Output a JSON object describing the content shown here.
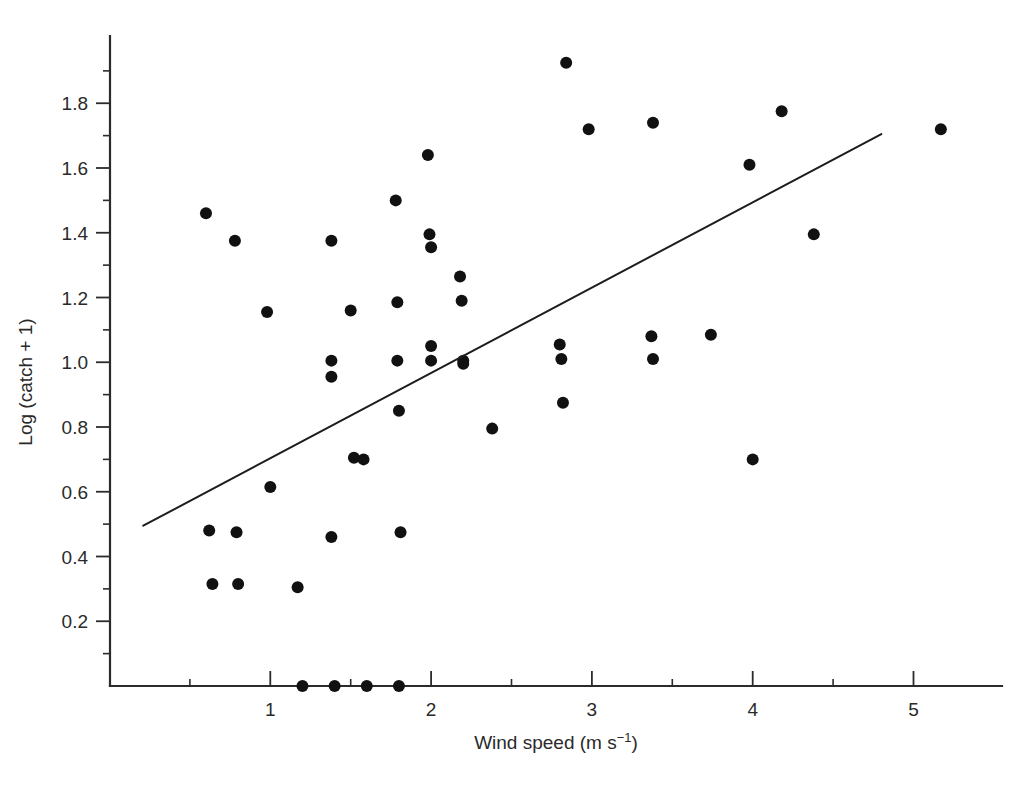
{
  "figure": {
    "background": "#ffffff",
    "point_color": "#111111",
    "line_color": "#1d1d1d",
    "axis_color": "#2b2b2b"
  },
  "axes": {
    "x_title_main": "Wind speed (m s",
    "x_title_sup": "−1",
    "x_title_tail": ")",
    "x_title_full": "Wind speed (m s−1)",
    "y_title": "Log (catch + 1)",
    "x_ticks": [
      1,
      2,
      3,
      4,
      5
    ],
    "x_tick_labels": [
      "1",
      "2",
      "3",
      "4",
      "5"
    ],
    "y_ticks": [
      0.2,
      0.4,
      0.6,
      0.8,
      1.0,
      1.2,
      1.4,
      1.6,
      1.8
    ],
    "y_tick_labels": [
      "0.2",
      "0.4",
      "0.6",
      "0.8",
      "1.0",
      "1.2",
      "1.4",
      "1.6",
      "1.8"
    ],
    "x_minor_ticks": [
      0.5,
      1.5,
      2.5,
      3.5,
      4.5
    ],
    "y_minor_ticks": [
      0.1,
      0.3,
      0.5,
      0.7,
      0.9,
      1.1,
      1.3,
      1.5,
      1.7,
      1.9
    ],
    "xlim": [
      0,
      5.6
    ],
    "ylim": [
      0,
      1.98
    ],
    "tick_direction_x": "in",
    "tick_direction_y": "out",
    "grid": false,
    "legend": "none"
  },
  "chart_data": {
    "type": "scatter",
    "title": "",
    "subtitle": "",
    "xlabel": "Wind speed (m s−1)",
    "ylabel": "Log (catch + 1)",
    "xlim": [
      0,
      5.6
    ],
    "ylim": [
      0,
      1.98
    ],
    "grid": false,
    "legend_position": "none",
    "marker": "filled-circle",
    "n_points": 60,
    "points": [
      {
        "x": 0.6,
        "y": 1.46
      },
      {
        "x": 0.62,
        "y": 0.48
      },
      {
        "x": 0.64,
        "y": 0.315
      },
      {
        "x": 0.78,
        "y": 1.375
      },
      {
        "x": 0.79,
        "y": 0.475
      },
      {
        "x": 0.8,
        "y": 0.315
      },
      {
        "x": 0.98,
        "y": 1.155
      },
      {
        "x": 1.0,
        "y": 0.615
      },
      {
        "x": 1.17,
        "y": 0.305
      },
      {
        "x": 1.2,
        "y": 0.0
      },
      {
        "x": 1.38,
        "y": 1.375
      },
      {
        "x": 1.38,
        "y": 1.005
      },
      {
        "x": 1.38,
        "y": 0.955
      },
      {
        "x": 1.38,
        "y": 0.46
      },
      {
        "x": 1.4,
        "y": 0.0
      },
      {
        "x": 1.5,
        "y": 1.16
      },
      {
        "x": 1.52,
        "y": 0.705
      },
      {
        "x": 1.58,
        "y": 0.7
      },
      {
        "x": 1.6,
        "y": 0.0
      },
      {
        "x": 1.78,
        "y": 1.5
      },
      {
        "x": 1.79,
        "y": 1.185
      },
      {
        "x": 1.79,
        "y": 1.005
      },
      {
        "x": 1.8,
        "y": 0.85
      },
      {
        "x": 1.81,
        "y": 0.475
      },
      {
        "x": 1.8,
        "y": 0.0
      },
      {
        "x": 1.98,
        "y": 1.64
      },
      {
        "x": 1.99,
        "y": 1.395
      },
      {
        "x": 2.0,
        "y": 1.355
      },
      {
        "x": 2.0,
        "y": 1.05
      },
      {
        "x": 2.0,
        "y": 1.005
      },
      {
        "x": 2.18,
        "y": 1.265
      },
      {
        "x": 2.19,
        "y": 1.19
      },
      {
        "x": 2.2,
        "y": 1.005
      },
      {
        "x": 2.2,
        "y": 0.995
      },
      {
        "x": 2.38,
        "y": 0.795
      },
      {
        "x": 2.8,
        "y": 1.055
      },
      {
        "x": 2.81,
        "y": 1.01
      },
      {
        "x": 2.82,
        "y": 0.875
      },
      {
        "x": 2.84,
        "y": 1.925
      },
      {
        "x": 2.98,
        "y": 1.72
      },
      {
        "x": 3.38,
        "y": 1.74
      },
      {
        "x": 3.37,
        "y": 1.08
      },
      {
        "x": 3.38,
        "y": 1.01
      },
      {
        "x": 3.74,
        "y": 1.085
      },
      {
        "x": 3.98,
        "y": 1.61
      },
      {
        "x": 4.0,
        "y": 0.7
      },
      {
        "x": 4.18,
        "y": 1.775
      },
      {
        "x": 4.38,
        "y": 1.395
      },
      {
        "x": 5.17,
        "y": 1.72
      }
    ],
    "fit_line": {
      "label": "linear regression",
      "x_start": 0.21,
      "y_start": 0.495,
      "x_end": 4.8,
      "y_end": 1.705,
      "slope": 0.264,
      "intercept": 0.44
    }
  }
}
